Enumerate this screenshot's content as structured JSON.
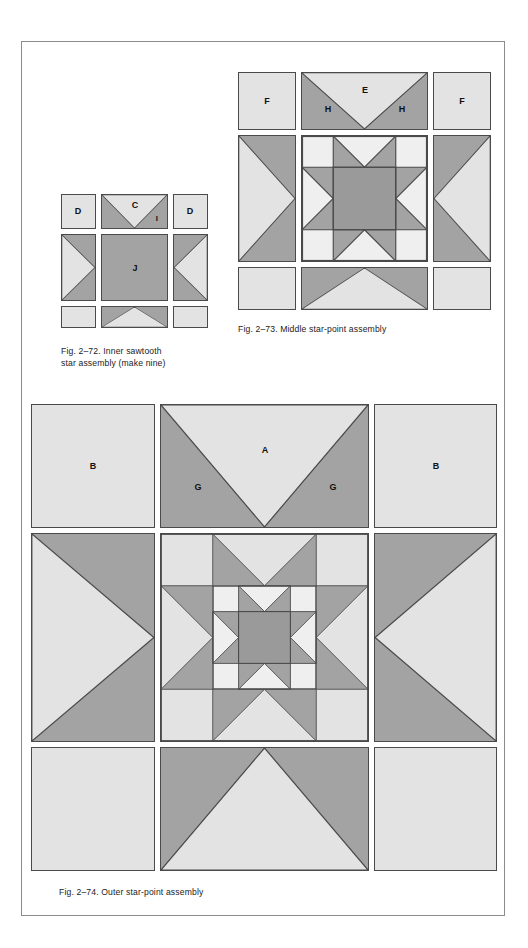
{
  "page": {
    "background": "#ffffff",
    "frame_border_color": "#8c8c8c"
  },
  "palette": {
    "light": "#e3e3e3",
    "very_light": "#efefef",
    "medium": "#a3a3a3",
    "dark": "#9a9a9a",
    "line": "#4a4a4a",
    "text": "#111111"
  },
  "figures": [
    {
      "id": "fig-2-72",
      "caption": "Fig. 2–72. Inner sawtooth\nstar assembly (make nine)",
      "title": "Inner sawtooth star assembly",
      "note": "make nine",
      "number": "2–72",
      "labels": [
        {
          "text": "D",
          "role": "corner-square-left"
        },
        {
          "text": "C",
          "role": "flying-geese-background"
        },
        {
          "text": "I",
          "role": "flying-geese-point"
        },
        {
          "text": "D",
          "role": "corner-square-right"
        },
        {
          "text": "J",
          "role": "center-square"
        }
      ]
    },
    {
      "id": "fig-2-73",
      "caption": "Fig. 2–73. Middle star-point assembly",
      "title": "Middle star-point assembly",
      "number": "2–73",
      "labels": [
        {
          "text": "F",
          "role": "corner-square-left"
        },
        {
          "text": "E",
          "role": "flying-geese-background"
        },
        {
          "text": "H",
          "role": "star-point-left"
        },
        {
          "text": "H",
          "role": "star-point-right"
        },
        {
          "text": "F",
          "role": "corner-square-right"
        }
      ]
    },
    {
      "id": "fig-2-74",
      "caption": "Fig. 2–74. Outer star-point assembly",
      "title": "Outer star-point assembly",
      "number": "2–74",
      "labels": [
        {
          "text": "B",
          "role": "corner-square-left"
        },
        {
          "text": "A",
          "role": "flying-geese-background"
        },
        {
          "text": "G",
          "role": "star-point-left"
        },
        {
          "text": "G",
          "role": "star-point-right"
        },
        {
          "text": "B",
          "role": "corner-square-right"
        }
      ]
    }
  ],
  "fig72": {
    "label_D_left": "D",
    "label_C": "C",
    "label_I": "I",
    "label_D_right": "D",
    "label_J": "J",
    "caption": "Fig. 2–72. Inner sawtooth\nstar assembly (make nine)"
  },
  "fig73": {
    "label_F_left": "F",
    "label_E": "E",
    "label_H_left": "H",
    "label_H_right": "H",
    "label_F_right": "F",
    "caption": "Fig. 2–73. Middle star-point assembly"
  },
  "fig74": {
    "label_B_left": "B",
    "label_A": "A",
    "label_G_left": "G",
    "label_G_right": "G",
    "label_B_right": "B",
    "caption": "Fig. 2–74. Outer star-point assembly"
  }
}
